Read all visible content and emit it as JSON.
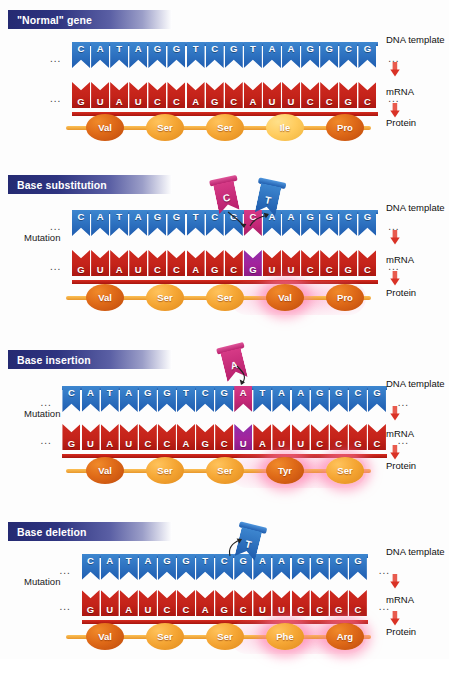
{
  "figure": {
    "legend_labels": [
      "DNA template",
      "mRNA",
      "Protein"
    ],
    "mutation_label": "Mutation",
    "ellipsis": "...",
    "arrow_color": "#e03a2f",
    "dna_color": "#2f74c2",
    "rna_color": "#c4231a",
    "mutation_dna_color": "#c52878",
    "mutation_rna_color": "#a3239b",
    "protein_color": "#f5a634",
    "banner_color": "#2e3480",
    "highlight_glow_color": "#ff6eaa"
  },
  "panels": [
    {
      "id": "normal-gene",
      "banner": "\"Normal\" gene",
      "mutation_label": "",
      "dna": [
        "C",
        "A",
        "T",
        "A",
        "G",
        "G",
        "T",
        "C",
        "G",
        "T",
        "A",
        "A",
        "G",
        "G",
        "C",
        "G"
      ],
      "dna_mutated_index": -1,
      "mrna": [
        "G",
        "U",
        "A",
        "U",
        "C",
        "C",
        "A",
        "G",
        "C",
        "A",
        "U",
        "U",
        "C",
        "C",
        "G",
        "C"
      ],
      "mrna_mutated_index": -1,
      "protein": [
        {
          "label": "Val",
          "shade": "dark",
          "glow": false
        },
        {
          "label": "Ser",
          "shade": "mid",
          "glow": false
        },
        {
          "label": "Ser",
          "shade": "mid",
          "glow": false
        },
        {
          "label": "Ile",
          "shade": "light",
          "glow": false
        },
        {
          "label": "Pro",
          "shade": "dark",
          "glow": false
        }
      ],
      "tokens": []
    },
    {
      "id": "base-substitution",
      "banner": "Base substitution",
      "mutation_label": "Mutation",
      "dna": [
        "C",
        "A",
        "T",
        "A",
        "G",
        "G",
        "T",
        "C",
        "G",
        "C",
        "A",
        "A",
        "G",
        "G",
        "C",
        "G"
      ],
      "dna_mutated_index": 9,
      "mrna": [
        "G",
        "U",
        "A",
        "U",
        "C",
        "C",
        "A",
        "G",
        "C",
        "G",
        "U",
        "U",
        "C",
        "C",
        "G",
        "C"
      ],
      "mrna_mutated_index": 9,
      "protein": [
        {
          "label": "Val",
          "shade": "dark",
          "glow": false
        },
        {
          "label": "Ser",
          "shade": "mid",
          "glow": false
        },
        {
          "label": "Ser",
          "shade": "mid",
          "glow": false
        },
        {
          "label": "Val",
          "shade": "dark",
          "glow": true
        },
        {
          "label": "Pro",
          "shade": "dark",
          "glow": false
        }
      ],
      "tokens": [
        {
          "letter": "C",
          "color": "pink",
          "role": "incoming-base"
        },
        {
          "letter": "T",
          "color": "blue",
          "role": "outgoing-base"
        }
      ]
    },
    {
      "id": "base-insertion",
      "banner": "Base insertion",
      "mutation_label": "Mutation",
      "dna": [
        "C",
        "A",
        "T",
        "A",
        "G",
        "G",
        "T",
        "C",
        "G",
        "A",
        "T",
        "A",
        "A",
        "G",
        "G",
        "C",
        "G"
      ],
      "dna_mutated_index": 9,
      "mrna": [
        "G",
        "U",
        "A",
        "U",
        "C",
        "C",
        "A",
        "G",
        "C",
        "U",
        "A",
        "U",
        "U",
        "C",
        "C",
        "G",
        "C"
      ],
      "mrna_mutated_index": 9,
      "protein": [
        {
          "label": "Val",
          "shade": "dark",
          "glow": false
        },
        {
          "label": "Ser",
          "shade": "mid",
          "glow": false
        },
        {
          "label": "Ser",
          "shade": "mid",
          "glow": false
        },
        {
          "label": "Tyr",
          "shade": "dark",
          "glow": true
        },
        {
          "label": "Ser",
          "shade": "mid",
          "glow": true
        }
      ],
      "tokens": [
        {
          "letter": "A",
          "color": "pink",
          "role": "inserted-base"
        }
      ]
    },
    {
      "id": "base-deletion",
      "banner": "Base deletion",
      "mutation_label": "Mutation",
      "dna": [
        "C",
        "A",
        "T",
        "A",
        "G",
        "G",
        "T",
        "C",
        "G",
        "A",
        "A",
        "G",
        "G",
        "C",
        "G"
      ],
      "dna_mutated_index": -1,
      "mrna": [
        "G",
        "U",
        "A",
        "U",
        "C",
        "C",
        "A",
        "G",
        "C",
        "U",
        "U",
        "C",
        "C",
        "G",
        "C"
      ],
      "mrna_mutated_index": -1,
      "protein": [
        {
          "label": "Val",
          "shade": "dark",
          "glow": false
        },
        {
          "label": "Ser",
          "shade": "mid",
          "glow": false
        },
        {
          "label": "Ser",
          "shade": "mid",
          "glow": false
        },
        {
          "label": "Phe",
          "shade": "mid",
          "glow": true
        },
        {
          "label": "Arg",
          "shade": "dark",
          "glow": true
        }
      ],
      "tokens": [
        {
          "letter": "T",
          "color": "blue",
          "role": "deleted-base"
        }
      ]
    }
  ]
}
